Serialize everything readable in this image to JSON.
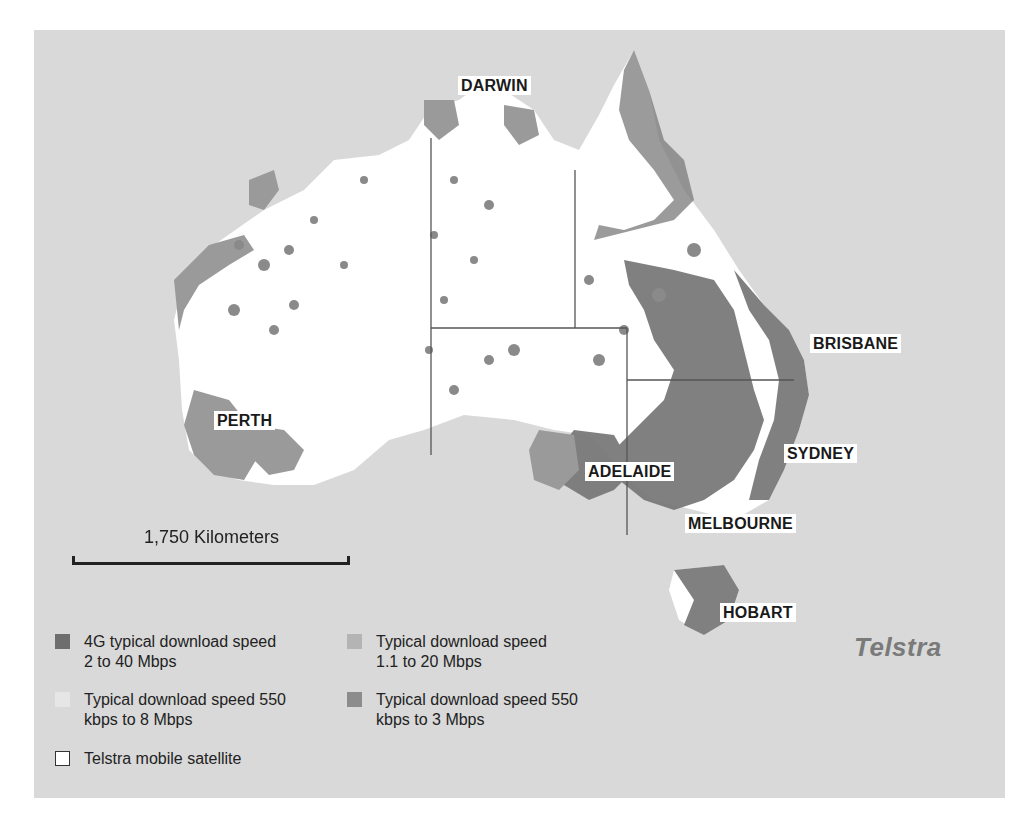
{
  "map": {
    "title": "Telstra mobile network coverage — Australia",
    "background_color": "#d9d9d9",
    "land_color": "#ffffff",
    "cities": [
      {
        "name": "DARWIN",
        "x": 427,
        "y": 47
      },
      {
        "name": "BRISBANE",
        "x": 776,
        "y": 304
      },
      {
        "name": "PERTH",
        "x": 178,
        "y": 381
      },
      {
        "name": "SYDNEY",
        "x": 750,
        "y": 414
      },
      {
        "name": "ADELAIDE",
        "x": 551,
        "y": 431
      },
      {
        "name": "MELBOURNE",
        "x": 650,
        "y": 484
      },
      {
        "name": "HOBART",
        "x": 686,
        "y": 573
      }
    ],
    "scale": {
      "label": "1,750 Kilometers"
    },
    "brand_logo": "Telstra"
  },
  "legend": {
    "items": [
      {
        "label_line1": "4G typical download speed",
        "label_line2": "2 to 40 Mbps",
        "color": "#6e6e6e",
        "bordered": false
      },
      {
        "label_line1": "Typical download speed",
        "label_line2": "1.1 to 20 Mbps",
        "color": "#b4b4b4",
        "bordered": false
      },
      {
        "label_line1": "Typical download speed 550",
        "label_line2": "kbps to 8 Mbps",
        "color": "#e6e6e6",
        "bordered": false
      },
      {
        "label_line1": "Typical download speed 550",
        "label_line2": "kbps to 3 Mbps",
        "color": "#8c8c8c",
        "bordered": false
      },
      {
        "label_line1": "Telstra mobile satellite",
        "label_line2": "",
        "color": "#ffffff",
        "bordered": true
      }
    ]
  }
}
